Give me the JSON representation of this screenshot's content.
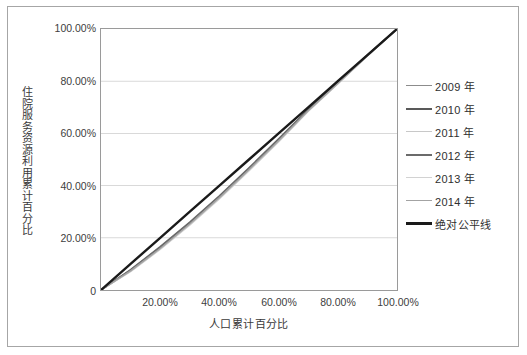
{
  "chart_data": {
    "type": "line",
    "title": "",
    "subtitle": "",
    "xlabel": "人口累计百分比",
    "ylabel": "住院服务资源利用累计百分比",
    "xlim": [
      0,
      1
    ],
    "ylim": [
      0,
      1
    ],
    "grid": "horizontal",
    "legend_position": "right",
    "x_tick_labels": [
      "20.00%",
      "40.00%",
      "60.00%",
      "80.00%",
      "100.00%"
    ],
    "x_tick_values": [
      0.2,
      0.4,
      0.6,
      0.8,
      1.0
    ],
    "y_tick_labels": [
      "0",
      "20.00%",
      "40.00%",
      "60.00%",
      "80.00%",
      "100.00%"
    ],
    "y_tick_values": [
      0,
      0.2,
      0.4,
      0.6,
      0.8,
      1.0
    ],
    "x": [
      0,
      0.1,
      0.2,
      0.3,
      0.4,
      0.5,
      0.6,
      0.7,
      0.8,
      0.9,
      1.0
    ],
    "series": [
      {
        "name": "2009 年",
        "color": "#8c8c8c",
        "width": 1.4,
        "values": [
          0,
          0.074,
          0.16,
          0.254,
          0.355,
          0.462,
          0.573,
          0.688,
          0.792,
          0.898,
          1.0
        ]
      },
      {
        "name": "2010 年",
        "color": "#595959",
        "width": 1.6,
        "values": [
          0,
          0.076,
          0.163,
          0.257,
          0.358,
          0.465,
          0.576,
          0.69,
          0.794,
          0.899,
          1.0
        ]
      },
      {
        "name": "2011 年",
        "color": "#c8c8c8",
        "width": 1.3,
        "values": [
          0,
          0.072,
          0.157,
          0.251,
          0.352,
          0.459,
          0.57,
          0.686,
          0.79,
          0.897,
          1.0
        ]
      },
      {
        "name": "2012 年",
        "color": "#6b6b6b",
        "width": 1.6,
        "values": [
          0,
          0.078,
          0.166,
          0.26,
          0.361,
          0.468,
          0.579,
          0.692,
          0.796,
          0.9,
          1.0
        ]
      },
      {
        "name": "2013 年",
        "color": "#d2d2d2",
        "width": 1.3,
        "values": [
          0,
          0.07,
          0.155,
          0.248,
          0.349,
          0.456,
          0.567,
          0.684,
          0.789,
          0.896,
          1.0
        ]
      },
      {
        "name": "2014 年",
        "color": "#a3a3a3",
        "width": 1.5,
        "values": [
          0,
          0.073,
          0.159,
          0.253,
          0.354,
          0.461,
          0.572,
          0.687,
          0.791,
          0.898,
          1.0
        ]
      },
      {
        "name": "绝对公平线",
        "color": "#1a1a1a",
        "width": 2.4,
        "values": [
          0,
          0.1,
          0.2,
          0.3,
          0.4,
          0.5,
          0.6,
          0.7,
          0.8,
          0.9,
          1.0
        ]
      }
    ]
  },
  "legend": {
    "items": [
      {
        "label": "2009 年",
        "color": "#8c8c8c",
        "width": 1.8
      },
      {
        "label": "2010 年",
        "color": "#595959",
        "width": 2.0
      },
      {
        "label": "2011 年",
        "color": "#c8c8c8",
        "width": 1.6
      },
      {
        "label": "2012 年",
        "color": "#6b6b6b",
        "width": 2.0
      },
      {
        "label": "2013 年",
        "color": "#d2d2d2",
        "width": 1.6
      },
      {
        "label": "2014 年",
        "color": "#a3a3a3",
        "width": 1.8
      },
      {
        "label": "绝对公平线",
        "color": "#1a1a1a",
        "width": 3.0
      }
    ]
  },
  "style": {
    "plot_border_color": "#9a9a9a",
    "gridline_color": "#d9d9d9",
    "outer_border_color": "#a6a6a6",
    "tick_label_color": "#404040",
    "axis_title_color": "#3a3a3a",
    "background": "#ffffff"
  }
}
